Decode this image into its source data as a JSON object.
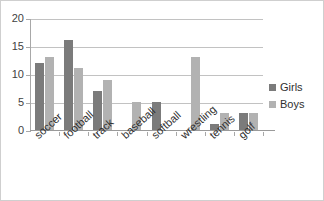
{
  "chart_data": {
    "type": "bar",
    "title": "",
    "xlabel": "",
    "ylabel": "",
    "ylim": [
      0,
      20
    ],
    "yticks": [
      0,
      5,
      10,
      15,
      20
    ],
    "grid": true,
    "legend_position": "right",
    "categories": [
      "soccer",
      "football",
      "track",
      "baseball",
      "softball",
      "wrestling",
      "tennis",
      "golf"
    ],
    "series": [
      {
        "name": "Girls",
        "color": "#7b7b7b",
        "values": [
          12,
          16,
          7,
          0,
          5,
          0,
          1,
          3
        ]
      },
      {
        "name": "Boys",
        "color": "#b2b2b2",
        "values": [
          13,
          11,
          9,
          5,
          0,
          13,
          3,
          3
        ]
      }
    ]
  },
  "axis": {
    "y_tick_labels": [
      "20",
      "15",
      "10",
      "5",
      "0"
    ]
  },
  "legend": {
    "items": [
      {
        "label": "Girls"
      },
      {
        "label": "Boys"
      }
    ]
  },
  "clipped_title": ""
}
